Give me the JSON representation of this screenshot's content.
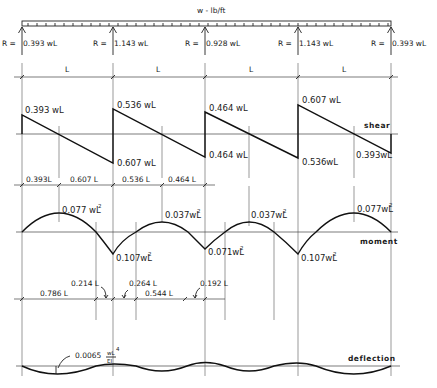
{
  "load": {
    "label": "w - lb/ft"
  },
  "supports_x": [
    22,
    113,
    205,
    298,
    391
  ],
  "reactions": [
    {
      "label": "R =",
      "value": "0.393 wL"
    },
    {
      "label": "R =",
      "value": "1.143 wL"
    },
    {
      "label": "R =",
      "value": "0.928 wL"
    },
    {
      "label": "R =",
      "value": "1.143 wL"
    },
    {
      "label": "R =",
      "value": "0.393 wL"
    }
  ],
  "spans": [
    {
      "label": "L"
    },
    {
      "label": "L"
    },
    {
      "label": "L"
    },
    {
      "label": "L"
    }
  ],
  "shear": {
    "tag": "shear",
    "labels": [
      {
        "text": "0.393 wL"
      },
      {
        "text": "0.536 wL"
      },
      {
        "text": "0.607 wL"
      },
      {
        "text": "0.464 wL"
      },
      {
        "text": "0.464 wL"
      },
      {
        "text": "0.607 wL"
      },
      {
        "text": "0.536wL"
      },
      {
        "text": "0.393wL"
      }
    ],
    "dims": [
      {
        "text": "0.393L"
      },
      {
        "text": "0.607 L"
      },
      {
        "text": "0.536 L"
      },
      {
        "text": "0.464 L"
      }
    ]
  },
  "moment": {
    "tag": "moment",
    "labels": [
      {
        "text": "0.077 wL",
        "exp": "2"
      },
      {
        "text": "0.037wL",
        "exp": "2"
      },
      {
        "text": "0.037wL",
        "exp": "2"
      },
      {
        "text": "0.077wL",
        "exp": "2"
      },
      {
        "text": "0.107wL",
        "exp": "2"
      },
      {
        "text": "0.071wL",
        "exp": "2"
      },
      {
        "text": "0.107wL",
        "exp": "2"
      }
    ],
    "dims": [
      {
        "text": "0.786 L"
      },
      {
        "text": "0.214 L"
      },
      {
        "text": "0.264 L"
      },
      {
        "text": "0.544 L"
      },
      {
        "text": "0.192 L"
      }
    ]
  },
  "deflection": {
    "tag": "deflection",
    "max_label": "0.0065",
    "frac_num": "wL",
    "frac_exp": "4",
    "frac_den": "EI"
  },
  "colors": {
    "ink": "#111111",
    "guide": "#555555",
    "background": "#ffffff"
  }
}
